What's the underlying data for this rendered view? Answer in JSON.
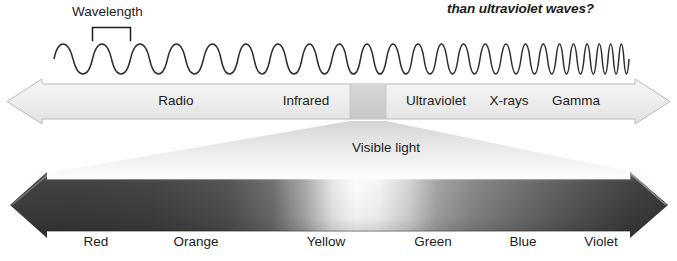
{
  "header": {
    "question_fragment": "than ultraviolet waves?"
  },
  "wave_diagram": {
    "wavelength_label": "Wavelength",
    "wave_color": "#2b2b2b",
    "bracket_color": "#1c1c1c"
  },
  "spectrum_bar": {
    "bar_fill": "#eeeeee",
    "bar_edge": "#b4b4b4",
    "visible_segment_fill": "#cfcfcf",
    "bands": [
      {
        "label": "Radio",
        "center_x": 176
      },
      {
        "label": "Infrared",
        "center_x": 306
      },
      {
        "label": "Ultraviolet",
        "center_x": 436
      },
      {
        "label": "X-rays",
        "center_x": 509
      },
      {
        "label": "Gamma",
        "center_x": 576
      }
    ]
  },
  "visible_light": {
    "caption": "Visible light",
    "funnel_fill": "#e9e9e9",
    "colours": [
      {
        "label": "Red",
        "center_x": 96,
        "hex": "#3b3b3b"
      },
      {
        "label": "Orange",
        "center_x": 196,
        "hex": "#4a4a4a"
      },
      {
        "label": "Yellow",
        "center_x": 326,
        "hex": "#f4f4f4"
      },
      {
        "label": "Green",
        "center_x": 433,
        "hex": "#8f8f8f"
      },
      {
        "label": "Blue",
        "center_x": 523,
        "hex": "#5d5d5d"
      },
      {
        "label": "Violet",
        "center_x": 601,
        "hex": "#363636"
      }
    ]
  }
}
